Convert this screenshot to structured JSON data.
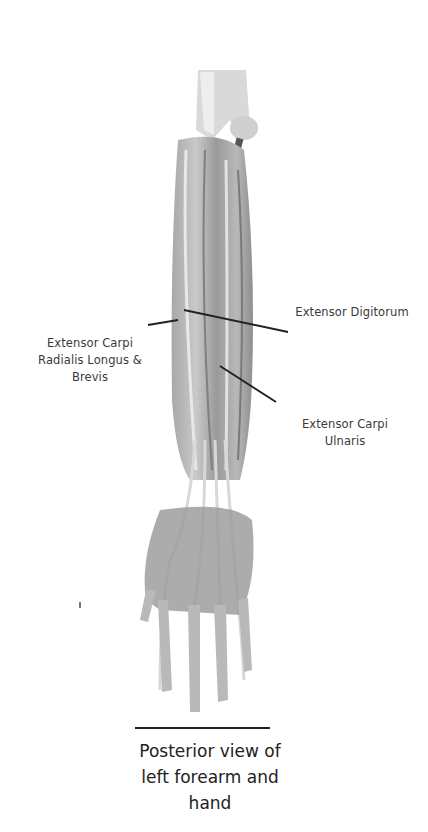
{
  "diagram": {
    "colors": {
      "background": "#ffffff",
      "muscle_dark": "#8a8a8a",
      "muscle_mid": "#b5b5b5",
      "tendon_light": "#dedede",
      "leader_line": "#222222",
      "label_text": "#3a3a3a"
    },
    "labels": [
      {
        "id": "ecrl",
        "line1": "Extensor Carpi",
        "line2": "Radialis Longus &",
        "line3": "Brevis"
      },
      {
        "id": "ed",
        "line1": "Extensor Digitorum"
      },
      {
        "id": "ecu",
        "line1": "Extensor Carpi",
        "line2": "Ulnaris"
      }
    ],
    "caption": {
      "line1": "Posterior view of",
      "line2": "left forearm and",
      "line3": "hand"
    }
  }
}
